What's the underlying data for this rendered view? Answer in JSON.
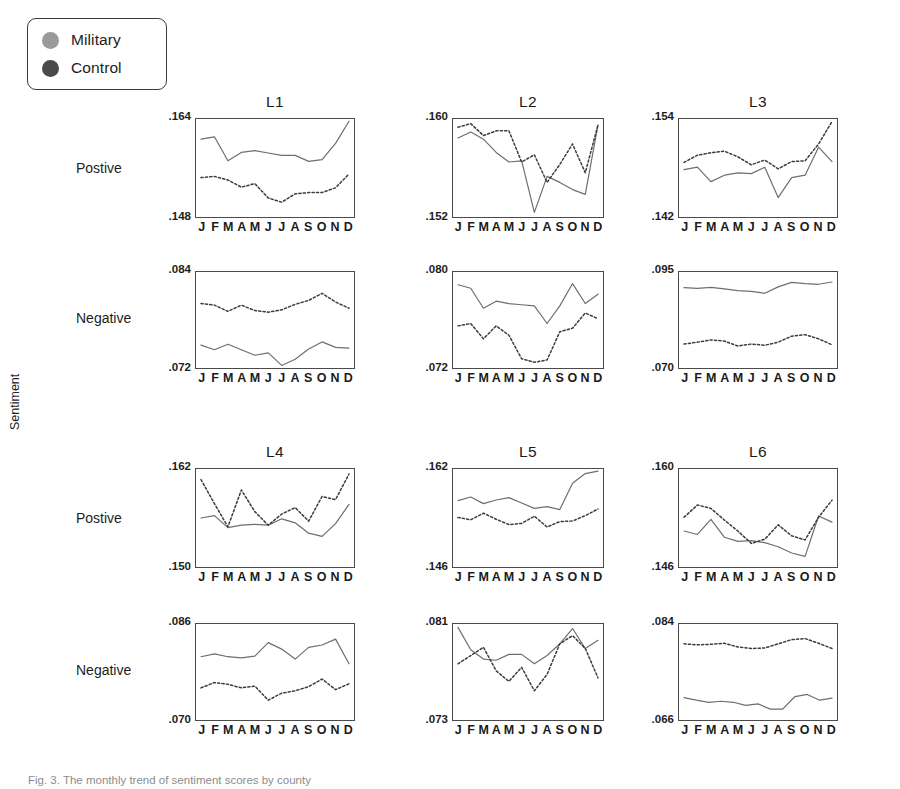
{
  "figure": {
    "ylabel": "Sentiment",
    "caption": "Fig. 3. The monthly trend of sentiment scores by county",
    "row_labels": [
      "Postive",
      "Negative",
      "Postive",
      "Negative"
    ],
    "months": [
      "J",
      "F",
      "M",
      "A",
      "M",
      "J",
      "J",
      "A",
      "S",
      "O",
      "N",
      "D"
    ]
  },
  "legend": {
    "items": [
      {
        "label": "Military",
        "color": "#9a9a9a",
        "style": "solid"
      },
      {
        "label": "Control",
        "color": "#4a4a4a",
        "style": "dotted"
      }
    ]
  },
  "chart_data": [
    {
      "type": "line",
      "title": "L1",
      "row": "Postive",
      "xlabel": "",
      "ylabel": "Sentiment",
      "x": [
        "J",
        "F",
        "M",
        "A",
        "M",
        "J",
        "J",
        "A",
        "S",
        "O",
        "N",
        "D"
      ],
      "ylim": [
        0.148,
        0.164
      ],
      "yticks": [
        ".148",
        ".164"
      ],
      "grid": false,
      "series": [
        {
          "name": "Military",
          "style": "solid",
          "values": [
            0.1608,
            0.1612,
            0.1572,
            0.1586,
            0.1589,
            0.1585,
            0.1581,
            0.1581,
            0.1571,
            0.1574,
            0.1601,
            0.1638
          ]
        },
        {
          "name": "Control",
          "style": "dotted",
          "values": [
            0.1544,
            0.1546,
            0.154,
            0.1528,
            0.1534,
            0.151,
            0.1503,
            0.1517,
            0.1519,
            0.1519,
            0.1527,
            0.155
          ]
        }
      ]
    },
    {
      "type": "line",
      "title": "L2",
      "row": "Postive",
      "x": [
        "J",
        "F",
        "M",
        "A",
        "M",
        "J",
        "J",
        "A",
        "S",
        "O",
        "N",
        "D"
      ],
      "ylim": [
        0.152,
        0.16
      ],
      "yticks": [
        ".152",
        ".160"
      ],
      "grid": false,
      "series": [
        {
          "name": "Military",
          "style": "solid",
          "values": [
            0.1585,
            0.159,
            0.1584,
            0.1573,
            0.1565,
            0.1566,
            0.1523,
            0.1553,
            0.1548,
            0.1542,
            0.1538,
            0.1596
          ]
        },
        {
          "name": "Control",
          "style": "dotted",
          "values": [
            0.1594,
            0.1597,
            0.1587,
            0.1591,
            0.1591,
            0.1565,
            0.1571,
            0.1548,
            0.1563,
            0.158,
            0.1556,
            0.1596
          ]
        }
      ]
    },
    {
      "type": "line",
      "title": "L3",
      "row": "Postive",
      "x": [
        "J",
        "F",
        "M",
        "A",
        "M",
        "J",
        "J",
        "A",
        "S",
        "O",
        "N",
        "D"
      ],
      "ylim": [
        0.142,
        0.154
      ],
      "yticks": [
        ".142",
        ".154"
      ],
      "grid": false,
      "series": [
        {
          "name": "Military",
          "style": "solid",
          "values": [
            0.1478,
            0.1481,
            0.1463,
            0.1471,
            0.1474,
            0.1473,
            0.1481,
            0.1443,
            0.1468,
            0.1471,
            0.1506,
            0.1488
          ]
        },
        {
          "name": "Control",
          "style": "dotted",
          "values": [
            0.1487,
            0.1496,
            0.1499,
            0.1501,
            0.1494,
            0.1484,
            0.149,
            0.1479,
            0.1488,
            0.1489,
            0.151,
            0.1538
          ]
        }
      ]
    },
    {
      "type": "line",
      "title": "L1",
      "row": "Negative",
      "x": [
        "J",
        "F",
        "M",
        "A",
        "M",
        "J",
        "J",
        "A",
        "S",
        "O",
        "N",
        "D"
      ],
      "ylim": [
        0.072,
        0.084
      ],
      "yticks": [
        ".072",
        ".084"
      ],
      "grid": false,
      "series": [
        {
          "name": "Military",
          "style": "solid",
          "values": [
            0.0748,
            0.0742,
            0.0749,
            0.0742,
            0.0735,
            0.0738,
            0.0722,
            0.073,
            0.0743,
            0.0752,
            0.0745,
            0.0744
          ]
        },
        {
          "name": "Control",
          "style": "dotted",
          "values": [
            0.0801,
            0.0799,
            0.0791,
            0.0799,
            0.0792,
            0.079,
            0.0793,
            0.08,
            0.0805,
            0.0814,
            0.0803,
            0.0795
          ]
        }
      ]
    },
    {
      "type": "line",
      "title": "L2",
      "row": "Negative",
      "x": [
        "J",
        "F",
        "M",
        "A",
        "M",
        "J",
        "J",
        "A",
        "S",
        "O",
        "N",
        "D"
      ],
      "ylim": [
        0.072,
        0.08
      ],
      "yticks": [
        ".072",
        ".080"
      ],
      "grid": false,
      "series": [
        {
          "name": "Military",
          "style": "solid",
          "values": [
            0.079,
            0.0787,
            0.077,
            0.0776,
            0.0774,
            0.0773,
            0.0772,
            0.0757,
            0.0772,
            0.0791,
            0.0774,
            0.0782
          ]
        },
        {
          "name": "Control",
          "style": "dotted",
          "values": [
            0.0755,
            0.0757,
            0.0744,
            0.0755,
            0.0747,
            0.0727,
            0.0724,
            0.0726,
            0.075,
            0.0753,
            0.0766,
            0.0761
          ]
        }
      ]
    },
    {
      "type": "line",
      "title": "L3",
      "row": "Negative",
      "x": [
        "J",
        "F",
        "M",
        "A",
        "M",
        "J",
        "J",
        "A",
        "S",
        "O",
        "N",
        "D"
      ],
      "ylim": [
        0.07,
        0.095
      ],
      "yticks": [
        ".070",
        ".095"
      ],
      "grid": false,
      "series": [
        {
          "name": "Military",
          "style": "solid",
          "values": [
            0.0911,
            0.0909,
            0.0912,
            0.0908,
            0.0903,
            0.0901,
            0.0896,
            0.0913,
            0.0925,
            0.0922,
            0.092,
            0.0926
          ]
        },
        {
          "name": "Control",
          "style": "dotted",
          "values": [
            0.0761,
            0.0766,
            0.0772,
            0.0769,
            0.0756,
            0.0761,
            0.0758,
            0.0766,
            0.0782,
            0.0786,
            0.0775,
            0.0759
          ]
        }
      ]
    },
    {
      "type": "line",
      "title": "L4",
      "row": "Postive",
      "x": [
        "J",
        "F",
        "M",
        "A",
        "M",
        "J",
        "J",
        "A",
        "S",
        "O",
        "N",
        "D"
      ],
      "ylim": [
        0.15,
        0.162
      ],
      "yticks": [
        ".150",
        ".162"
      ],
      "grid": false,
      "series": [
        {
          "name": "Military",
          "style": "solid",
          "values": [
            0.156,
            0.1563,
            0.1548,
            0.1551,
            0.1552,
            0.1551,
            0.1559,
            0.1554,
            0.1541,
            0.1537,
            0.1553,
            0.1577
          ]
        },
        {
          "name": "Control",
          "style": "dotted",
          "values": [
            0.1608,
            0.1578,
            0.1549,
            0.1595,
            0.1568,
            0.1551,
            0.1565,
            0.1573,
            0.1556,
            0.1587,
            0.1583,
            0.1615
          ]
        }
      ]
    },
    {
      "type": "line",
      "title": "L5",
      "row": "Postive",
      "x": [
        "J",
        "F",
        "M",
        "A",
        "M",
        "J",
        "J",
        "A",
        "S",
        "O",
        "N",
        "D"
      ],
      "ylim": [
        0.146,
        0.162
      ],
      "yticks": [
        ".146",
        ".162"
      ],
      "grid": false,
      "series": [
        {
          "name": "Military",
          "style": "solid",
          "values": [
            0.1569,
            0.1575,
            0.1564,
            0.157,
            0.1574,
            0.1565,
            0.1556,
            0.1559,
            0.1554,
            0.1598,
            0.1614,
            0.1618
          ]
        },
        {
          "name": "Control",
          "style": "dotted",
          "values": [
            0.1541,
            0.1537,
            0.1548,
            0.1538,
            0.1529,
            0.1531,
            0.1543,
            0.1525,
            0.1534,
            0.1535,
            0.1544,
            0.1555
          ]
        }
      ]
    },
    {
      "type": "line",
      "title": "L6",
      "row": "Postive",
      "x": [
        "J",
        "F",
        "M",
        "A",
        "M",
        "J",
        "J",
        "A",
        "S",
        "O",
        "N",
        "D"
      ],
      "ylim": [
        0.146,
        0.16
      ],
      "yticks": [
        ".146",
        ".160"
      ],
      "grid": false,
      "series": [
        {
          "name": "Military",
          "style": "solid",
          "values": [
            0.1511,
            0.1506,
            0.1528,
            0.1502,
            0.1496,
            0.1497,
            0.1494,
            0.1488,
            0.1479,
            0.1474,
            0.1533,
            0.1524
          ]
        },
        {
          "name": "Control",
          "style": "dotted",
          "values": [
            0.1531,
            0.1549,
            0.1544,
            0.1527,
            0.1511,
            0.1493,
            0.1499,
            0.152,
            0.1504,
            0.1498,
            0.1531,
            0.1556
          ]
        }
      ]
    },
    {
      "type": "line",
      "title": "L4",
      "row": "Negative",
      "x": [
        "J",
        "F",
        "M",
        "A",
        "M",
        "J",
        "J",
        "A",
        "S",
        "O",
        "N",
        "D"
      ],
      "ylim": [
        0.07,
        0.086
      ],
      "yticks": [
        ".070",
        ".086"
      ],
      "grid": false,
      "series": [
        {
          "name": "Military",
          "style": "solid",
          "values": [
            0.0806,
            0.0811,
            0.0806,
            0.0804,
            0.0807,
            0.083,
            0.0819,
            0.0802,
            0.0822,
            0.0826,
            0.0836,
            0.0794
          ]
        },
        {
          "name": "Control",
          "style": "dotted",
          "values": [
            0.0753,
            0.0762,
            0.0759,
            0.0753,
            0.0756,
            0.0732,
            0.0744,
            0.0748,
            0.0755,
            0.0768,
            0.075,
            0.076
          ]
        }
      ]
    },
    {
      "type": "line",
      "title": "L5",
      "row": "Negative",
      "x": [
        "J",
        "F",
        "M",
        "A",
        "M",
        "J",
        "J",
        "A",
        "S",
        "O",
        "N",
        "D"
      ],
      "ylim": [
        0.073,
        0.081
      ],
      "yticks": [
        ".073",
        ".081"
      ],
      "grid": false,
      "series": [
        {
          "name": "Military",
          "style": "solid",
          "values": [
            0.0808,
            0.0789,
            0.0781,
            0.078,
            0.0785,
            0.0785,
            0.0777,
            0.0784,
            0.0794,
            0.0807,
            0.079,
            0.0797
          ]
        },
        {
          "name": "Control",
          "style": "dotted",
          "values": [
            0.0777,
            0.0784,
            0.0791,
            0.0771,
            0.0762,
            0.0774,
            0.0754,
            0.0768,
            0.0794,
            0.0801,
            0.079,
            0.0765
          ]
        }
      ]
    },
    {
      "type": "line",
      "title": "L6",
      "row": "Negative",
      "x": [
        "J",
        "F",
        "M",
        "A",
        "M",
        "J",
        "J",
        "A",
        "S",
        "O",
        "N",
        "D"
      ],
      "ylim": [
        0.066,
        0.084
      ],
      "yticks": [
        ".066",
        ".084"
      ],
      "grid": false,
      "series": [
        {
          "name": "Military",
          "style": "solid",
          "values": [
            0.0701,
            0.0696,
            0.0692,
            0.0694,
            0.0692,
            0.0686,
            0.0689,
            0.0679,
            0.0679,
            0.0703,
            0.0707,
            0.0696,
            0.07
          ]
        },
        {
          "name": "Control",
          "style": "dotted",
          "values": [
            0.0804,
            0.0802,
            0.0803,
            0.0805,
            0.0798,
            0.0795,
            0.0796,
            0.0804,
            0.0812,
            0.0814,
            0.0805,
            0.0795
          ]
        }
      ]
    }
  ],
  "layout": {
    "panels": [
      {
        "left": 195,
        "top": 118,
        "w": 160,
        "h": 100
      },
      {
        "left": 452,
        "top": 118,
        "w": 152,
        "h": 100
      },
      {
        "left": 678,
        "top": 118,
        "w": 160,
        "h": 100
      },
      {
        "left": 195,
        "top": 271,
        "w": 160,
        "h": 98
      },
      {
        "left": 452,
        "top": 271,
        "w": 152,
        "h": 98
      },
      {
        "left": 678,
        "top": 271,
        "w": 160,
        "h": 98
      },
      {
        "left": 195,
        "top": 468,
        "w": 160,
        "h": 100
      },
      {
        "left": 452,
        "top": 468,
        "w": 152,
        "h": 100
      },
      {
        "left": 678,
        "top": 468,
        "w": 160,
        "h": 100
      },
      {
        "left": 195,
        "top": 623,
        "w": 160,
        "h": 98
      },
      {
        "left": 452,
        "top": 623,
        "w": 152,
        "h": 98
      },
      {
        "left": 678,
        "top": 623,
        "w": 160,
        "h": 98
      }
    ],
    "row_label_positions": [
      {
        "left": 76,
        "top": 160
      },
      {
        "left": 76,
        "top": 310
      },
      {
        "left": 76,
        "top": 510
      },
      {
        "left": 76,
        "top": 662
      }
    ]
  }
}
